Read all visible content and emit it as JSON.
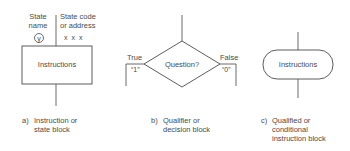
{
  "diagram": {
    "block_a": {
      "state_name_label": [
        "State",
        "name"
      ],
      "state_name_symbol": "y",
      "state_code_label": [
        "State code",
        "or address"
      ],
      "state_code_value": "x x x",
      "box_text": "Instructions",
      "caption_letter": "a)",
      "caption_lines": [
        "Instruction or",
        "state block"
      ]
    },
    "block_b": {
      "diamond_text": "Question?",
      "true_label": "True",
      "true_value": "“1”",
      "false_label": "False",
      "false_value": "“0”",
      "caption_letter": "b)",
      "caption_lines": [
        "Qualifier or",
        "decision block"
      ]
    },
    "block_c": {
      "box_text": "Instructions",
      "caption_letter": "c)",
      "caption_lines": [
        "Qualified or",
        "conditional",
        "instruction block"
      ]
    }
  }
}
